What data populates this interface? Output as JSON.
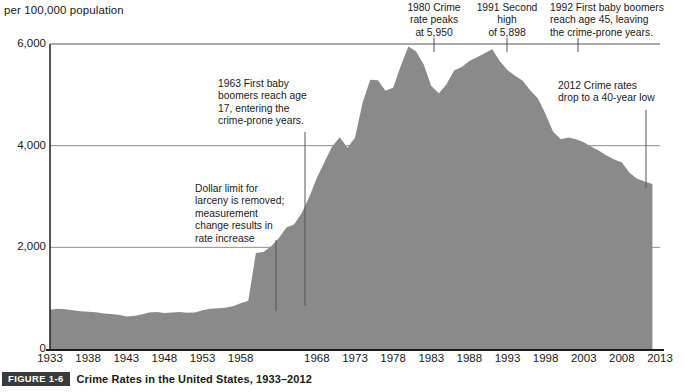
{
  "figure": {
    "badge_label": "FIGURE 1-6",
    "caption": "Crime Rates in the United States, 1933–2012",
    "y_axis_title": "per 100,000 population"
  },
  "annotations": [
    {
      "id": "ann-1963",
      "text": "1963 First baby\nboomers reach age\n17, entering the\ncrime-prone years.",
      "x": 218,
      "y": 78,
      "width": 112,
      "align": "left",
      "leader_x": 305,
      "leader_y1": 132,
      "leader_y2": 306
    },
    {
      "id": "ann-dollar-limit",
      "text": "Dollar limit for\nlarceny is removed;\nmeasurement\nchange results in\nrate increase",
      "x": 195,
      "y": 183,
      "width": 108,
      "align": "left",
      "leader_x": 276,
      "leader_y1": 240,
      "leader_y2": 311
    },
    {
      "id": "ann-1980-peak",
      "text": "1980 Crime\nrate peaks\nat 5,950",
      "x": 390,
      "y": 2,
      "width": 88,
      "align": "center",
      "leader_x": 434,
      "leader_y1": 38,
      "leader_y2": 52
    },
    {
      "id": "ann-1991-second-high",
      "text": "1991 Second\nhigh\nof 5,898",
      "x": 466,
      "y": 2,
      "width": 82,
      "align": "center",
      "leader_x": 507,
      "leader_y1": 38,
      "leader_y2": 52
    },
    {
      "id": "ann-1992-boomers-45",
      "text": "1992 First baby boomers\nreach age 45, leaving\nthe crime-prone years.",
      "x": 550,
      "y": 2,
      "width": 134,
      "align": "left",
      "leader_x": 578,
      "leader_y1": 38,
      "leader_y2": 52
    },
    {
      "id": "ann-2012-low",
      "text": "2012 Crime rates\ndrop to a 40-year low",
      "x": 558,
      "y": 80,
      "width": 126,
      "align": "left",
      "leader_x": 646,
      "leader_y1": 110,
      "leader_y2": 188
    }
  ],
  "colors": {
    "area_fill": "#8a8a8a",
    "axis_line": "#2b2b2b",
    "gridline": "#8c8c8c",
    "baseline": "#1c1c1c",
    "badge_bg": "#3b3b3b",
    "text": "#1a1a1a"
  },
  "chart_data": {
    "type": "area",
    "title": "Crime Rates in the United States, 1933–2012",
    "xlabel": "",
    "ylabel": "per 100,000 population",
    "xlim": [
      1933,
      2013
    ],
    "ylim": [
      0,
      6400
    ],
    "xticks": [
      1933,
      1938,
      1943,
      1948,
      1953,
      1958,
      1968,
      1973,
      1978,
      1983,
      1988,
      1993,
      1998,
      2003,
      2008,
      2013
    ],
    "yticks": [
      0,
      2000,
      4000,
      6000
    ],
    "ytick_labels": [
      "0",
      "2,000",
      "4,000",
      "6,000"
    ],
    "grid": true,
    "legend": "none",
    "series": [
      {
        "name": "Crime rate per 100,000 population",
        "x": [
          1933,
          1934,
          1935,
          1936,
          1937,
          1938,
          1939,
          1940,
          1941,
          1942,
          1943,
          1944,
          1945,
          1946,
          1947,
          1948,
          1949,
          1950,
          1951,
          1952,
          1953,
          1954,
          1955,
          1956,
          1957,
          1958,
          1959,
          1960,
          1961,
          1962,
          1963,
          1964,
          1965,
          1966,
          1967,
          1968,
          1969,
          1970,
          1971,
          1972,
          1973,
          1974,
          1975,
          1976,
          1977,
          1978,
          1979,
          1980,
          1981,
          1982,
          1983,
          1984,
          1985,
          1986,
          1987,
          1988,
          1989,
          1990,
          1991,
          1992,
          1993,
          1994,
          1995,
          1996,
          1997,
          1998,
          1999,
          2000,
          2001,
          2002,
          2003,
          2004,
          2005,
          2006,
          2007,
          2008,
          2009,
          2010,
          2011,
          2012
        ],
        "values": [
          770,
          790,
          780,
          760,
          745,
          735,
          725,
          700,
          690,
          675,
          640,
          650,
          680,
          720,
          730,
          710,
          720,
          730,
          715,
          720,
          760,
          790,
          800,
          810,
          840,
          900,
          950,
          1887,
          1906,
          2020,
          2180,
          2388,
          2449,
          2670,
          2990,
          3370,
          3680,
          3985,
          4165,
          3961,
          4154,
          4850,
          5298,
          5287,
          5078,
          5140,
          5566,
          5950,
          5858,
          5604,
          5175,
          5031,
          5207,
          5480,
          5550,
          5664,
          5741,
          5820,
          5898,
          5660,
          5487,
          5374,
          5275,
          5087,
          4930,
          4620,
          4267,
          4125,
          4163,
          4125,
          4068,
          3977,
          3900,
          3808,
          3730,
          3667,
          3466,
          3350,
          3295,
          3246
        ]
      }
    ],
    "data_labels": [
      {
        "year": 1980,
        "value": 5950,
        "note": "Crime rate peaks at 5,950"
      },
      {
        "year": 1991,
        "value": 5898,
        "note": "Second high of 5,898"
      },
      {
        "year": 2012,
        "value": 3246,
        "note": "Crime rates drop to a 40-year low"
      }
    ]
  }
}
